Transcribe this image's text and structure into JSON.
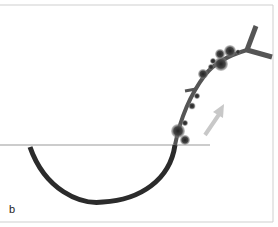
{
  "panel_label": "b",
  "colors": {
    "arc": "#2b2b2b",
    "stalk": "#555555",
    "surface_line": "#bbbbbb",
    "arrow": "#c8c8c8",
    "frame": "#cfcfcf",
    "particles": "#3a3a3a"
  },
  "elements": {
    "surface": "horizontal-membrane-line",
    "curve": "curved-filament",
    "arrow": "direction-arrow",
    "branch": "y-shaped-branch-end"
  }
}
